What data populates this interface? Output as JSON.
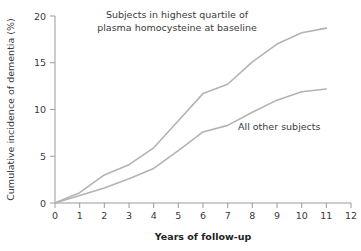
{
  "chart_data": {
    "type": "line",
    "title": "",
    "xlabel": "Years of follow-up",
    "ylabel": "Cumulative incidence of dementia (%)",
    "xlim": [
      0,
      12
    ],
    "ylim": [
      0,
      20
    ],
    "xticks": [
      "0",
      "1",
      "2",
      "3",
      "4",
      "5",
      "6",
      "7",
      "8",
      "9",
      "10",
      "11",
      "12"
    ],
    "yticks": [
      "0",
      "5",
      "10",
      "15",
      "20"
    ],
    "grid": false,
    "legend_position": "inline-annotation",
    "line_color": "#b3b3b3",
    "axis_color": "#9a9a9a",
    "text_color": "#3a3a3a",
    "background": "#ffffff",
    "x": [
      0,
      1,
      2,
      3,
      4,
      5,
      6,
      7,
      8,
      9,
      10,
      11
    ],
    "series": [
      {
        "name": "Subjects in highest quartile of plasma homocysteine at baseline",
        "short_name": "highest-quartile",
        "values": [
          0,
          1.1,
          3.0,
          4.1,
          5.9,
          8.8,
          11.7,
          12.7,
          15.1,
          17.0,
          18.2,
          18.7
        ]
      },
      {
        "name": "All other subjects",
        "short_name": "all-other-subjects",
        "values": [
          0,
          0.8,
          1.6,
          2.6,
          3.7,
          5.6,
          7.6,
          8.3,
          9.7,
          11.0,
          11.9,
          12.2
        ]
      }
    ],
    "annotations": [
      {
        "id": "annotation-highest-quartile",
        "lines": [
          "Subjects in highest quartile of",
          "plasma homocysteine at baseline"
        ]
      },
      {
        "id": "annotation-all-other",
        "lines": [
          "All other subjects"
        ]
      }
    ]
  }
}
